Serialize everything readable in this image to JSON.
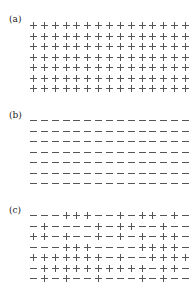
{
  "panels": [
    {
      "label": "(a)",
      "rows": [
        "+++++++++++++++",
        "+++++++++++++++",
        "+++++++++++++++",
        "+++++++++++++++",
        "+++++++++++++++",
        "+++++++++++++++",
        "+++++++++++++++"
      ]
    },
    {
      "label": "(b)",
      "rows": [
        "---------------",
        "---------------",
        "---------------",
        "---------------",
        "---------------",
        "---------------",
        "---------------"
      ]
    },
    {
      "label": "(c)",
      "rows": [
        "---+++--+-++-+-",
        "-+----+-++--+--",
        "++-+--+-+-+-++-",
        "---+++----++++-",
        "+++++++-+--++++",
        "-++++++++++-++--",
        "-+-+--+---+-+--"
      ]
    }
  ]
}
